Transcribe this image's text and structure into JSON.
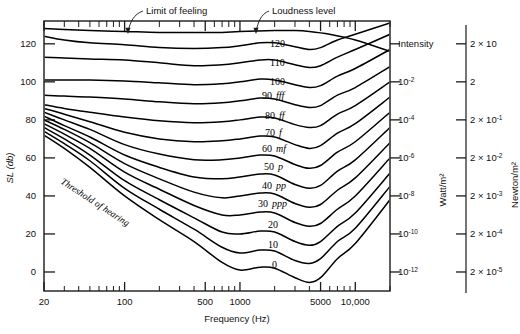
{
  "figure": {
    "annotations": [
      {
        "name": "limit-of-feeling",
        "text": "Limit of feeling"
      },
      {
        "name": "loudness-level",
        "text": "Loudness level"
      },
      {
        "name": "threshold-of-hearing",
        "text": "Threshold of hearing"
      }
    ]
  },
  "chart_data": {
    "type": "line",
    "title": "",
    "xlabel": "Frequency (Hz)",
    "ylabel": "SL (db)",
    "xscale": "log",
    "xlim": [
      20,
      20000
    ],
    "ylim": [
      -10,
      132
    ],
    "grid": false,
    "legend": "inline-curve-labels",
    "xticks": [
      {
        "value": 20,
        "label": "20"
      },
      {
        "value": 100,
        "label": "100"
      },
      {
        "value": 500,
        "label": "500"
      },
      {
        "value": 1000,
        "label": "1000"
      },
      {
        "value": 5000,
        "label": "5000"
      },
      {
        "value": 10000,
        "label": "10,000"
      }
    ],
    "xminor": [
      30,
      40,
      50,
      60,
      70,
      80,
      90,
      200,
      300,
      400,
      600,
      700,
      800,
      900,
      2000,
      3000,
      4000,
      6000,
      7000,
      8000,
      9000,
      20000
    ],
    "yticks": [
      {
        "value": 0,
        "label": "0"
      },
      {
        "value": 20,
        "label": "20"
      },
      {
        "value": 40,
        "label": "40"
      },
      {
        "value": 60,
        "label": "60"
      },
      {
        "value": 80,
        "label": "80"
      },
      {
        "value": 100,
        "label": "100"
      },
      {
        "value": 120,
        "label": "120"
      }
    ],
    "secondary_axes": [
      {
        "name": "intensity-axis",
        "title": "Watt/m²",
        "header": "Intensity",
        "ticks": [
          {
            "db": 120,
            "label": "Intensity",
            "is_header": true
          },
          {
            "db": 100,
            "base": "10",
            "exp": "-2"
          },
          {
            "db": 80,
            "base": "10",
            "exp": "-4"
          },
          {
            "db": 60,
            "base": "10",
            "exp": "-6"
          },
          {
            "db": 40,
            "base": "10",
            "exp": "-8"
          },
          {
            "db": 20,
            "base": "10",
            "exp": "-10"
          },
          {
            "db": 0,
            "base": "10",
            "exp": "-12"
          }
        ]
      },
      {
        "name": "pressure-axis",
        "title": "Newton/m²",
        "header": "",
        "ticks": [
          {
            "db": 120,
            "base": "2 × 10",
            "exp": ""
          },
          {
            "db": 100,
            "base": "2",
            "exp": ""
          },
          {
            "db": 80,
            "base": "2 × 10",
            "exp": "-1"
          },
          {
            "db": 60,
            "base": "2 × 10",
            "exp": "-2"
          },
          {
            "db": 40,
            "base": "2 × 10",
            "exp": "-3"
          },
          {
            "db": 20,
            "base": "2 × 10",
            "exp": "-4"
          },
          {
            "db": 0,
            "base": "2 × 10",
            "exp": "-5"
          }
        ]
      }
    ],
    "series": [
      {
        "name": "limit-of-feeling",
        "label": "",
        "dynamic": "",
        "x": [
          20,
          30,
          50,
          100,
          200,
          400,
          700,
          1000,
          2000,
          3000,
          4000,
          6000,
          10000,
          20000
        ],
        "y": [
          128,
          127.5,
          127,
          126.5,
          126,
          126,
          126,
          126.5,
          127,
          127,
          126.5,
          125,
          122,
          116
        ]
      },
      {
        "name": "phon-120",
        "label": "120",
        "dynamic": "",
        "x": [
          20,
          30,
          50,
          100,
          200,
          400,
          700,
          1000,
          1500,
          2000,
          3000,
          4000,
          5000,
          7000,
          10000,
          20000
        ],
        "y": [
          124,
          122,
          120.5,
          119.5,
          118,
          117.5,
          118,
          119,
          120.5,
          120.5,
          118.5,
          117,
          118,
          122,
          125,
          131
        ]
      },
      {
        "name": "phon-110",
        "label": "110",
        "dynamic": "",
        "x": [
          20,
          30,
          50,
          100,
          200,
          400,
          700,
          1000,
          1500,
          2000,
          3000,
          4000,
          5000,
          7000,
          10000,
          20000
        ],
        "y": [
          113,
          112.5,
          112,
          111.5,
          110,
          108.5,
          109,
          110,
          111.5,
          111.5,
          109,
          107.5,
          108.5,
          113,
          117,
          125
        ]
      },
      {
        "name": "phon-100",
        "label": "100",
        "dynamic": "",
        "x": [
          20,
          30,
          50,
          100,
          200,
          400,
          700,
          1000,
          1500,
          2000,
          3000,
          4000,
          5000,
          7000,
          10000,
          20000
        ],
        "y": [
          101,
          101,
          101,
          100.5,
          99.5,
          98.5,
          99,
          100,
          101.5,
          101,
          98.5,
          97,
          98,
          103,
          107,
          117
        ]
      },
      {
        "name": "phon-90",
        "label": "90",
        "dynamic": "fff",
        "x": [
          20,
          30,
          50,
          100,
          200,
          400,
          700,
          1000,
          1500,
          2000,
          3000,
          4000,
          5000,
          7000,
          10000,
          20000
        ],
        "y": [
          93,
          92.5,
          92,
          91,
          89.5,
          88.5,
          89,
          90,
          91.5,
          91,
          88,
          86.5,
          87.5,
          93,
          97,
          108
        ]
      },
      {
        "name": "phon-80",
        "label": "80",
        "dynamic": "ff",
        "x": [
          20,
          30,
          50,
          100,
          200,
          400,
          700,
          1000,
          1500,
          2000,
          3000,
          4000,
          5000,
          7000,
          10000,
          20000
        ],
        "y": [
          88,
          86,
          84,
          81.5,
          79.5,
          78.5,
          79,
          80,
          81.5,
          81,
          77.5,
          76,
          77,
          83,
          87.5,
          100
        ]
      },
      {
        "name": "phon-70",
        "label": "70",
        "dynamic": "f",
        "x": [
          20,
          30,
          50,
          100,
          200,
          400,
          700,
          1000,
          1500,
          2000,
          3000,
          4000,
          5000,
          7000,
          10000,
          20000
        ],
        "y": [
          86,
          83,
          79,
          73.5,
          70,
          68.5,
          69,
          70,
          71.5,
          71,
          67,
          65,
          66.5,
          73,
          78,
          92
        ]
      },
      {
        "name": "phon-60",
        "label": "60",
        "dynamic": "mf",
        "x": [
          20,
          30,
          50,
          100,
          200,
          400,
          700,
          1000,
          1500,
          2000,
          3000,
          4000,
          5000,
          7000,
          10000,
          20000
        ],
        "y": [
          84,
          80,
          75,
          67,
          62,
          59,
          59,
          60,
          61.5,
          61,
          56.5,
          54.5,
          56,
          63,
          68.5,
          84
        ]
      },
      {
        "name": "phon-50",
        "label": "50",
        "dynamic": "p",
        "x": [
          20,
          30,
          50,
          100,
          200,
          400,
          700,
          1000,
          1500,
          2000,
          3000,
          4000,
          5000,
          7000,
          10000,
          20000
        ],
        "y": [
          82,
          77,
          71,
          61.5,
          55,
          50,
          49,
          50,
          51.5,
          51,
          46,
          44,
          45.5,
          53,
          59,
          76
        ]
      },
      {
        "name": "phon-40",
        "label": "40",
        "dynamic": "pp",
        "x": [
          20,
          30,
          50,
          100,
          200,
          400,
          700,
          1000,
          1500,
          2000,
          3000,
          4000,
          5000,
          7000,
          10000,
          20000
        ],
        "y": [
          80,
          75,
          68,
          57,
          49,
          42,
          39,
          40,
          41.5,
          41,
          36,
          34,
          35.5,
          43,
          49.5,
          68
        ]
      },
      {
        "name": "phon-30",
        "label": "30",
        "dynamic": "ppp",
        "x": [
          20,
          30,
          50,
          100,
          200,
          400,
          700,
          1000,
          1500,
          2000,
          3000,
          4000,
          5000,
          7000,
          10000,
          20000
        ],
        "y": [
          78,
          72.5,
          65,
          52.5,
          43.5,
          35,
          30,
          30,
          31.5,
          31,
          26,
          24,
          25.5,
          33,
          40,
          60
        ]
      },
      {
        "name": "phon-20",
        "label": "20",
        "dynamic": "",
        "x": [
          20,
          30,
          50,
          100,
          200,
          400,
          700,
          1000,
          1500,
          2000,
          3000,
          4000,
          5000,
          7000,
          10000,
          20000
        ],
        "y": [
          76,
          70,
          61.5,
          48,
          38,
          28.5,
          21,
          20,
          21.5,
          21,
          16,
          14,
          16,
          24,
          31,
          52
        ]
      },
      {
        "name": "phon-10",
        "label": "10",
        "dynamic": "",
        "x": [
          20,
          30,
          50,
          100,
          200,
          400,
          700,
          1000,
          1500,
          2000,
          3000,
          4000,
          5000,
          7000,
          10000,
          20000
        ],
        "y": [
          74,
          67.5,
          58.5,
          44,
          33,
          22.5,
          13,
          10,
          11.5,
          11,
          6,
          4.5,
          7,
          16,
          23,
          45
        ]
      },
      {
        "name": "phon-0",
        "label": "0",
        "dynamic": "",
        "x": [
          20,
          30,
          50,
          100,
          200,
          400,
          700,
          1000,
          1500,
          2000,
          3000,
          4000,
          5000,
          7000,
          10000,
          20000
        ],
        "y": [
          72,
          65,
          55,
          40,
          27.5,
          16,
          5,
          1,
          2.5,
          2,
          -3,
          -5.5,
          -3,
          7,
          15,
          38
        ]
      }
    ],
    "curve_labels": [
      {
        "name": "curve-label-120",
        "label": "120",
        "dynamic": "",
        "x": 270,
        "y": 47
      },
      {
        "name": "curve-label-110",
        "label": "110",
        "dynamic": "",
        "x": 270,
        "y": 66
      },
      {
        "name": "curve-label-100",
        "label": "100",
        "dynamic": "",
        "x": 270,
        "y": 85
      },
      {
        "name": "curve-label-90",
        "label": "90",
        "dynamic": "fff",
        "x": 262,
        "y": 99
      },
      {
        "name": "curve-label-80",
        "label": "80",
        "dynamic": "ff",
        "x": 265,
        "y": 119
      },
      {
        "name": "curve-label-70",
        "label": "70",
        "dynamic": "f",
        "x": 265,
        "y": 136
      },
      {
        "name": "curve-label-60",
        "label": "60",
        "dynamic": "mf",
        "x": 262,
        "y": 152
      },
      {
        "name": "curve-label-50",
        "label": "50",
        "dynamic": "p",
        "x": 264,
        "y": 170
      },
      {
        "name": "curve-label-40",
        "label": "40",
        "dynamic": "pp",
        "x": 262,
        "y": 189
      },
      {
        "name": "curve-label-30",
        "label": "30",
        "dynamic": "ppp",
        "x": 258,
        "y": 207
      },
      {
        "name": "curve-label-20",
        "label": "20",
        "dynamic": "",
        "x": 268,
        "y": 228
      },
      {
        "name": "curve-label-10",
        "label": "10",
        "dynamic": "",
        "x": 268,
        "y": 248
      },
      {
        "name": "curve-label-0",
        "label": "0",
        "dynamic": "",
        "x": 272,
        "y": 268
      }
    ]
  }
}
